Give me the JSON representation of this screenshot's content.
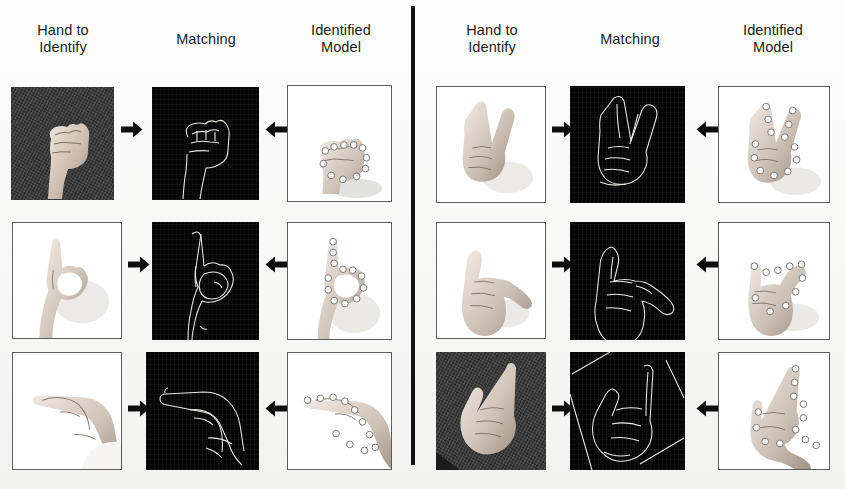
{
  "figure": {
    "background_color": "#f8f8f7",
    "divider_color": "#121212",
    "panels": [
      {
        "id": "left",
        "headers": {
          "hand_to_identify": "Hand to\nIdentify",
          "matching": "Matching",
          "identified_model": "Identified\nModel"
        },
        "rows": [
          {
            "gesture": "closed-fist",
            "input": {
              "type": "photo",
              "background": "dark-textured",
              "caption": ""
            },
            "matching": {
              "type": "edge-contour",
              "background": "black",
              "caption": ""
            },
            "model": {
              "type": "model-with-landmarks",
              "background": "white",
              "landmark_count": 11,
              "caption": ""
            }
          },
          {
            "gesture": "index-up-with-loop",
            "input": {
              "type": "photo",
              "background": "white",
              "caption": ""
            },
            "matching": {
              "type": "edge-contour",
              "background": "black",
              "caption": ""
            },
            "model": {
              "type": "model-with-landmarks",
              "background": "white",
              "landmark_count": 12,
              "caption": ""
            }
          },
          {
            "gesture": "pointing-left",
            "input": {
              "type": "photo",
              "background": "white",
              "caption": ""
            },
            "matching": {
              "type": "edge-contour",
              "background": "black",
              "caption": ""
            },
            "model": {
              "type": "model-with-landmarks",
              "background": "white",
              "landmark_count": 11,
              "caption": ""
            }
          }
        ]
      },
      {
        "id": "right",
        "headers": {
          "hand_to_identify": "Hand to\nIdentify",
          "matching": "Matching",
          "identified_model": "Identified\nModel"
        },
        "rows": [
          {
            "gesture": "victory-two-fingers",
            "input": {
              "type": "photo",
              "background": "white",
              "caption": ""
            },
            "matching": {
              "type": "edge-contour",
              "background": "black",
              "caption": ""
            },
            "model": {
              "type": "model-with-landmarks",
              "background": "white",
              "landmark_count": 13,
              "caption": ""
            }
          },
          {
            "gesture": "horns-y-sign",
            "input": {
              "type": "photo",
              "background": "white",
              "caption": ""
            },
            "matching": {
              "type": "edge-contour",
              "background": "black",
              "caption": ""
            },
            "model": {
              "type": "model-with-landmarks",
              "background": "white",
              "landmark_count": 10,
              "caption": ""
            }
          },
          {
            "gesture": "l-sign",
            "input": {
              "type": "photo",
              "background": "dark-textured",
              "caption": ""
            },
            "matching": {
              "type": "edge-contour",
              "background": "black",
              "caption": ""
            },
            "model": {
              "type": "model-with-landmarks",
              "background": "white",
              "landmark_count": 12,
              "caption": ""
            }
          }
        ]
      }
    ],
    "arrows": {
      "forward": "→",
      "backward": "←"
    }
  }
}
